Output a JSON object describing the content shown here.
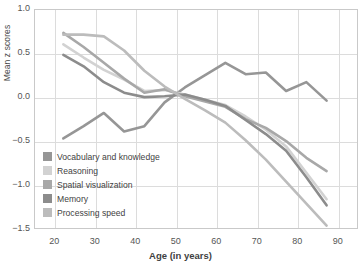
{
  "chart_data": {
    "type": "line",
    "title": "",
    "xlabel": "Age (in years)",
    "ylabel": "Mean z scores",
    "xlim": [
      15,
      95
    ],
    "ylim": [
      -1.5,
      1.0
    ],
    "xticks": [
      20,
      30,
      40,
      50,
      60,
      70,
      80,
      90
    ],
    "yticks": [
      -1.5,
      -1.0,
      -0.5,
      0.0,
      0.5,
      1.0
    ],
    "ytick_labels": [
      "−1.5",
      "−1.0",
      "−0.5",
      "0.0",
      "0.5",
      "1.0"
    ],
    "grid": true,
    "legend_position": "lower-left",
    "x": [
      22,
      27,
      32,
      37,
      42,
      47,
      52,
      57,
      62,
      67,
      72,
      77,
      82,
      87
    ],
    "series": [
      {
        "name": "Vocabulary and knowledge",
        "color": "#969696",
        "values": [
          -0.46,
          -0.32,
          -0.17,
          -0.38,
          -0.32,
          -0.05,
          0.12,
          0.26,
          0.4,
          0.27,
          0.29,
          0.08,
          0.18,
          -0.03
        ]
      },
      {
        "name": "Reasoning",
        "color": "#d2d2d2",
        "values": [
          0.61,
          0.46,
          0.32,
          0.21,
          0.08,
          0.09,
          0.04,
          -0.02,
          -0.08,
          -0.21,
          -0.36,
          -0.55,
          -0.85,
          -1.15
        ]
      },
      {
        "name": "Spatial visualization",
        "color": "#a8a8a8",
        "values": [
          0.74,
          0.58,
          0.4,
          0.22,
          0.06,
          0.1,
          0.02,
          -0.04,
          -0.1,
          -0.24,
          -0.34,
          -0.49,
          -0.68,
          -0.83
        ]
      },
      {
        "name": "Memory",
        "color": "#8c8c8c",
        "values": [
          0.49,
          0.36,
          0.18,
          0.06,
          0.01,
          0.02,
          0.04,
          -0.02,
          -0.09,
          -0.25,
          -0.41,
          -0.6,
          -0.9,
          -1.22
        ]
      },
      {
        "name": "Processing speed",
        "color": "#bcbcbc",
        "values": [
          0.72,
          0.72,
          0.7,
          0.54,
          0.31,
          0.13,
          -0.01,
          -0.14,
          -0.28,
          -0.48,
          -0.7,
          -0.95,
          -1.2,
          -1.45
        ]
      }
    ]
  }
}
